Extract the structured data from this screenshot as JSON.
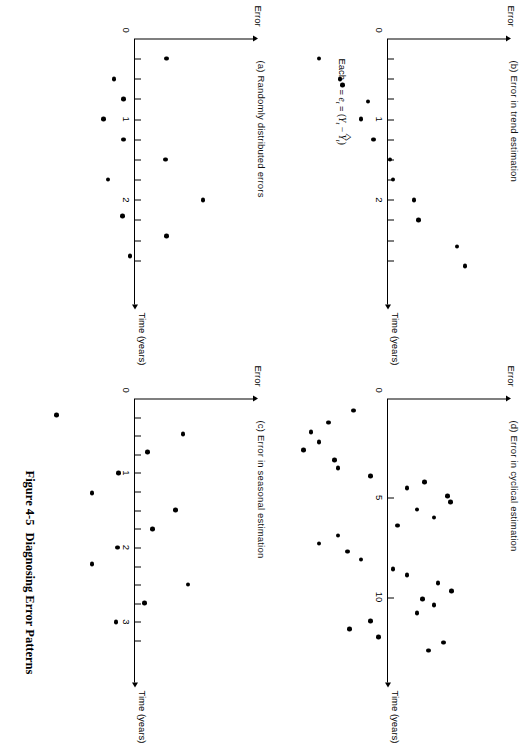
{
  "figure": {
    "number": "Figure 4-5",
    "title": "Diagnosing Error Patterns"
  },
  "legend": {
    "prefix": "Each",
    "equals_1": "=",
    "e_symbol": "e",
    "e_sub": "t",
    "equals_2": "=",
    "open": "(",
    "Y_symbol": "Y",
    "Y_sub": "t",
    "minus": "−",
    "Yhat_symbol": "Y",
    "Yhat_sub": "t",
    "close": ")"
  },
  "common": {
    "y_axis_label": "Error",
    "x_axis_label": "Time (years)",
    "origin_label": "0"
  },
  "chart_data": [
    {
      "id": "a",
      "type": "scatter",
      "title": "(a) Randomly distributed errors",
      "xlabel": "Time (years)",
      "ylabel": "Error",
      "xlim": [
        0,
        3.1
      ],
      "ylim": [
        -1,
        1
      ],
      "xticks": [
        0.25,
        0.5,
        0.75,
        1,
        1.25,
        1.5,
        1.75,
        2,
        2.25,
        2.5,
        2.75
      ],
      "xticklabels": {
        "1": "1",
        "2": "2"
      },
      "grid": false,
      "legend": "none",
      "points": [
        {
          "x": 0.25,
          "y": 0.33
        },
        {
          "x": 0.5,
          "y": -0.22
        },
        {
          "x": 0.75,
          "y": -0.12
        },
        {
          "x": 1.0,
          "y": -0.33
        },
        {
          "x": 1.25,
          "y": -0.12
        },
        {
          "x": 1.5,
          "y": 0.32
        },
        {
          "x": 1.75,
          "y": -0.28
        },
        {
          "x": 2.0,
          "y": 0.71
        },
        {
          "x": 2.2,
          "y": -0.13
        },
        {
          "x": 2.45,
          "y": 0.33
        },
        {
          "x": 2.7,
          "y": -0.05
        }
      ]
    },
    {
      "id": "b",
      "type": "scatter",
      "title": "(b) Error in trend estimation",
      "xlabel": "Time (years)",
      "ylabel": "Error",
      "xlim": [
        0,
        3.1
      ],
      "ylim": [
        -1,
        1
      ],
      "xticks": [
        0.25,
        0.5,
        0.75,
        1,
        1.25,
        1.5,
        1.75,
        2,
        2.25,
        2.5,
        2.75
      ],
      "xticklabels": {
        "1": "1",
        "2": "2"
      },
      "grid": false,
      "legend": "none",
      "points": [
        {
          "x": 0.25,
          "y": -0.72
        },
        {
          "x": 0.5,
          "y": -0.5
        },
        {
          "x": 0.78,
          "y": -0.21
        },
        {
          "x": 1.0,
          "y": -0.28
        },
        {
          "x": 1.25,
          "y": -0.15
        },
        {
          "x": 1.5,
          "y": 0.02
        },
        {
          "x": 1.75,
          "y": 0.05
        },
        {
          "x": 2.0,
          "y": 0.27
        },
        {
          "x": 2.25,
          "y": 0.32
        },
        {
          "x": 2.58,
          "y": 0.72
        },
        {
          "x": 2.82,
          "y": 0.8
        }
      ]
    },
    {
      "id": "c",
      "type": "scatter",
      "title": "(c) Error in seasonal estimation",
      "xlabel": "Time (years)",
      "ylabel": "Error",
      "xlim": [
        0,
        3.6
      ],
      "ylim": [
        -1,
        1
      ],
      "xticks": [
        0.25,
        0.5,
        0.75,
        1,
        1.25,
        1.5,
        1.75,
        2,
        2.25,
        2.5,
        2.75,
        3,
        3.25
      ],
      "xticklabels": {
        "1": "1",
        "2": "2",
        "3": "3"
      },
      "grid": false,
      "legend": "none",
      "points": [
        {
          "x": 0.22,
          "y": -0.82
        },
        {
          "x": 0.48,
          "y": 0.5
        },
        {
          "x": 0.72,
          "y": 0.13
        },
        {
          "x": 1.0,
          "y": -0.17
        },
        {
          "x": 1.27,
          "y": -0.45
        },
        {
          "x": 1.5,
          "y": 0.42
        },
        {
          "x": 1.75,
          "y": 0.18
        },
        {
          "x": 2.0,
          "y": -0.18
        },
        {
          "x": 2.22,
          "y": -0.45
        },
        {
          "x": 2.5,
          "y": 0.55
        },
        {
          "x": 2.75,
          "y": 0.1
        },
        {
          "x": 3.0,
          "y": -0.2
        }
      ]
    },
    {
      "id": "d",
      "type": "scatter",
      "title": "(d) Error in cyclical estimation",
      "xlabel": "Time (years)",
      "ylabel": "Error",
      "xlim": [
        0,
        13.5
      ],
      "ylim": [
        -1,
        1
      ],
      "xticks": [
        5,
        10
      ],
      "xticklabels": {
        "5": "5",
        "10": "10"
      },
      "grid": false,
      "legend": "none",
      "points": [
        {
          "x": 0.6,
          "y": -0.36
        },
        {
          "x": 1.2,
          "y": -0.62
        },
        {
          "x": 1.7,
          "y": -0.8
        },
        {
          "x": 2.2,
          "y": -0.72
        },
        {
          "x": 2.6,
          "y": -0.88
        },
        {
          "x": 3.1,
          "y": -0.56
        },
        {
          "x": 3.5,
          "y": -0.52
        },
        {
          "x": 3.9,
          "y": -0.18
        },
        {
          "x": 4.2,
          "y": 0.38
        },
        {
          "x": 4.5,
          "y": 0.2
        },
        {
          "x": 4.9,
          "y": 0.62
        },
        {
          "x": 5.2,
          "y": 0.65
        },
        {
          "x": 5.6,
          "y": 0.3
        },
        {
          "x": 6.0,
          "y": 0.48
        },
        {
          "x": 6.4,
          "y": 0.1
        },
        {
          "x": 6.9,
          "y": -0.52
        },
        {
          "x": 7.3,
          "y": -0.72
        },
        {
          "x": 7.7,
          "y": -0.42
        },
        {
          "x": 8.1,
          "y": -0.28
        },
        {
          "x": 8.6,
          "y": 0.05
        },
        {
          "x": 8.9,
          "y": 0.2
        },
        {
          "x": 9.3,
          "y": 0.52
        },
        {
          "x": 9.7,
          "y": 0.66
        },
        {
          "x": 10.1,
          "y": 0.36
        },
        {
          "x": 10.4,
          "y": 0.48
        },
        {
          "x": 10.8,
          "y": 0.3
        },
        {
          "x": 11.2,
          "y": -0.18
        },
        {
          "x": 11.6,
          "y": -0.4
        },
        {
          "x": 12.0,
          "y": -0.1
        },
        {
          "x": 12.3,
          "y": 0.58
        },
        {
          "x": 12.7,
          "y": 0.42
        }
      ]
    }
  ]
}
